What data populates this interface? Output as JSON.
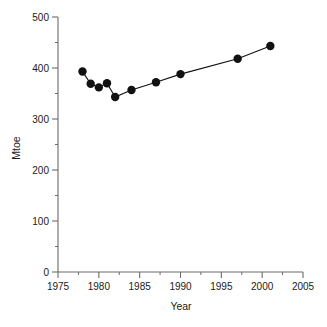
{
  "chart_data": {
    "type": "line",
    "title": "",
    "subtitle": "",
    "xlabel": "Year",
    "ylabel": "Mtoe",
    "xlim": [
      1975,
      2005
    ],
    "ylim": [
      0,
      500
    ],
    "grid": false,
    "legend": null,
    "x_major_ticks": [
      1975,
      1980,
      1985,
      1990,
      1995,
      2000,
      2005
    ],
    "x_major_tick_labels": [
      "1975",
      "1980",
      "1985",
      "1990",
      "1995",
      "2000",
      "2005"
    ],
    "x_minor_ticks": [
      1977.5,
      1982.5,
      1987.5,
      1992.5,
      1997.5,
      2002.5
    ],
    "y_major_ticks": [
      0,
      100,
      200,
      300,
      400,
      500
    ],
    "y_major_tick_labels": [
      "0",
      "100",
      "200",
      "300",
      "400",
      "500"
    ],
    "y_minor_ticks": [
      50,
      150,
      250,
      350,
      450
    ],
    "marker": "filled-circle",
    "marker_color": "#111111",
    "line_color": "#111111",
    "series": [
      {
        "name": "Energy consumption",
        "x": [
          1978,
          1979,
          1980,
          1981,
          1982,
          1984,
          1987,
          1990,
          1997,
          2001
        ],
        "values": [
          393,
          369,
          362,
          370,
          343,
          357,
          372,
          388,
          418,
          443
        ]
      }
    ]
  },
  "axis": {
    "y_title": "Mtoe",
    "x_title": "Year"
  }
}
